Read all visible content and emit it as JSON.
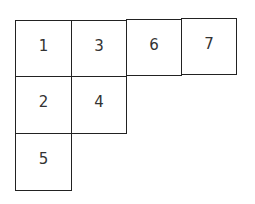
{
  "diagram": {
    "line_color": "#222222",
    "text_color": "#333333",
    "cells": [
      {
        "label": "1",
        "x": 15,
        "y": 20,
        "w": 57,
        "h": 57
      },
      {
        "label": "3",
        "x": 71,
        "y": 20,
        "w": 56,
        "h": 57
      },
      {
        "label": "6",
        "x": 126,
        "y": 19,
        "w": 56,
        "h": 57
      },
      {
        "label": "7",
        "x": 181,
        "y": 18,
        "w": 56,
        "h": 57
      },
      {
        "label": "2",
        "x": 15,
        "y": 76,
        "w": 57,
        "h": 58
      },
      {
        "label": "4",
        "x": 71,
        "y": 76,
        "w": 56,
        "h": 58
      },
      {
        "label": "5",
        "x": 15,
        "y": 133,
        "w": 57,
        "h": 58
      }
    ]
  }
}
